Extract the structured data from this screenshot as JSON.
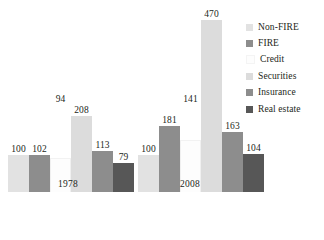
{
  "chart_data": {
    "type": "bar",
    "title": "",
    "subtitle": "",
    "xlabel": "",
    "ylabel": "",
    "ylim": [
      0,
      470
    ],
    "grid": false,
    "legend_position": "right",
    "categories": [
      "1978",
      "2008"
    ],
    "series": [
      {
        "name": "Non-FIRE",
        "color": "#e2e2e2",
        "values": [
          100,
          100
        ]
      },
      {
        "name": "FIRE",
        "color": "#8d8d8d",
        "values": [
          102,
          181
        ]
      },
      {
        "name": "Credit",
        "color": "#fdfdfd",
        "values": [
          94,
          141
        ]
      },
      {
        "name": "Securities",
        "color": "#dcdcdc",
        "values": [
          208,
          470
        ]
      },
      {
        "name": "Insurance",
        "color": "#8d8d8d",
        "values": [
          113,
          163
        ]
      },
      {
        "name": "Real estate",
        "color": "#575757",
        "values": [
          79,
          104
        ]
      }
    ],
    "groups": [
      {
        "label": "1978",
        "bars": [
          {
            "series": "Non-FIRE",
            "value": 100,
            "label": "100",
            "color": "#e2e2e2"
          },
          {
            "series": "FIRE",
            "value": 102,
            "label": "102",
            "color": "#8d8d8d"
          },
          {
            "series": "Credit",
            "value": 94,
            "label": "94",
            "color": "#fdfdfd"
          },
          {
            "series": "Securities",
            "value": 208,
            "label": "208",
            "color": "#dcdcdc"
          },
          {
            "series": "Insurance",
            "value": 113,
            "label": "113",
            "color": "#8d8d8d"
          },
          {
            "series": "Real estate",
            "value": 79,
            "label": "79",
            "color": "#575757"
          }
        ]
      },
      {
        "label": "2008",
        "bars": [
          {
            "series": "Non-FIRE",
            "value": 100,
            "label": "100",
            "color": "#e2e2e2"
          },
          {
            "series": "FIRE",
            "value": 181,
            "label": "181",
            "color": "#8d8d8d"
          },
          {
            "series": "Credit",
            "value": 141,
            "label": "141",
            "color": "#fdfdfd"
          },
          {
            "series": "Securities",
            "value": 470,
            "label": "470",
            "color": "#dcdcdc"
          },
          {
            "series": "Insurance",
            "value": 163,
            "label": "163",
            "color": "#8d8d8d"
          },
          {
            "series": "Real estate",
            "value": 104,
            "label": "104",
            "color": "#575757"
          }
        ]
      }
    ]
  },
  "legend": {
    "items": [
      {
        "label": "Non-FIRE",
        "color": "#e2e2e2"
      },
      {
        "label": "FIRE",
        "color": "#8d8d8d"
      },
      {
        "label": "Credit",
        "color": "#fdfdfd"
      },
      {
        "label": "Securities",
        "color": "#dcdcdc"
      },
      {
        "label": "Insurance",
        "color": "#8d8d8d"
      },
      {
        "label": "Real estate",
        "color": "#575757"
      }
    ]
  },
  "axis": {
    "group_labels": [
      "1978",
      "2008"
    ]
  }
}
